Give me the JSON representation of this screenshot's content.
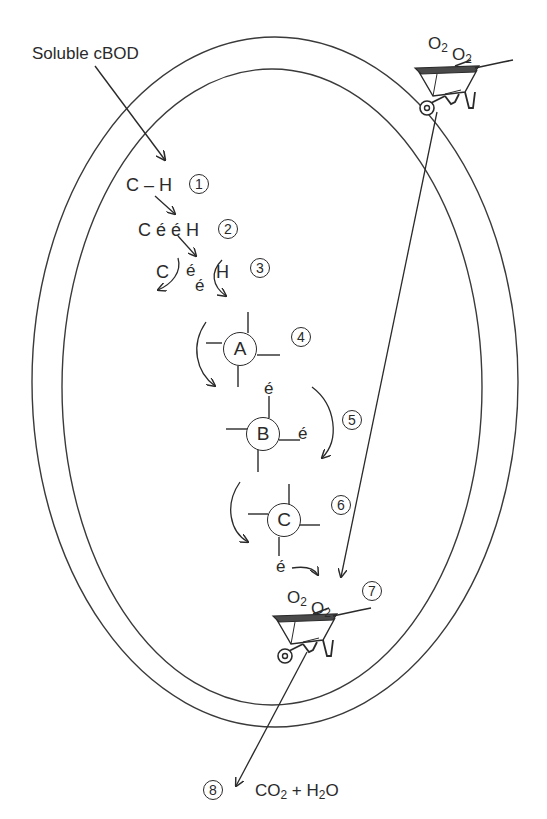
{
  "labels": {
    "soluble_cbod": "Soluble cBOD",
    "step1_text": "C – H",
    "step2_text": "C é é H",
    "step3_c": "C",
    "step3_e1": "é",
    "step3_e2": "é",
    "step3_h": "H",
    "electron": "é",
    "o2": "O",
    "o2_sub": "2",
    "product_co2": "CO",
    "product_sub": "2",
    "product_plus": " + H",
    "product_h2o_tail": "O"
  },
  "steps": [
    {
      "number": "1"
    },
    {
      "number": "2"
    },
    {
      "number": "3"
    },
    {
      "number": "4"
    },
    {
      "number": "5"
    },
    {
      "number": "6"
    },
    {
      "number": "7"
    },
    {
      "number": "8"
    }
  ],
  "carriers": [
    {
      "letter": "A"
    },
    {
      "letter": "B"
    },
    {
      "letter": "C"
    }
  ],
  "icons": {
    "wheelbarrow": "wheelbarrow-icon"
  },
  "colors": {
    "ink": "#2a2a2a",
    "background": "#ffffff"
  }
}
